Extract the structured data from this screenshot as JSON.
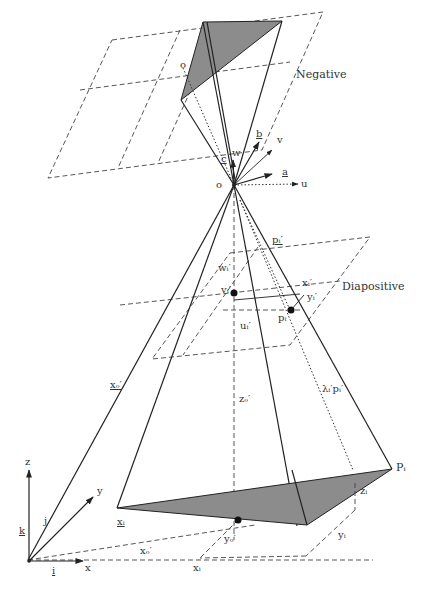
{
  "diagram": {
    "type": "photogrammetry-collinearity-geometry",
    "planes": {
      "negative": "Negative",
      "diapositive": "Diapositive"
    },
    "labels": {
      "o_top": "o",
      "c": "c",
      "w": "w",
      "b": "b",
      "v": "v",
      "a": "a",
      "u": "u",
      "o_center": "o",
      "wi": "wᵢ′",
      "pi_vec": "pᵢ′",
      "vi": "vᵢ′",
      "xi_prime": "xᵢ′",
      "yi_prime": "yᵢ′",
      "pi_small": "pᵢ",
      "ui": "uᵢ′",
      "xo_vec": "xₒ′",
      "zo": "zₒ′",
      "lambda_pi": "λᵢ′pᵢ′",
      "Pi": "Pᵢ",
      "zi": "zᵢ",
      "yi": "yᵢ",
      "xi_ground": "xᵢ",
      "yo": "yₒ′",
      "xo": "xₒ′",
      "xi_vec": "xᵢ",
      "z_axis": "z",
      "y_axis": "y",
      "x_axis": "x",
      "k": "k",
      "j": "j",
      "i": "i"
    },
    "colors": {
      "shade": "#8c8c8c",
      "line": "#222222"
    }
  }
}
